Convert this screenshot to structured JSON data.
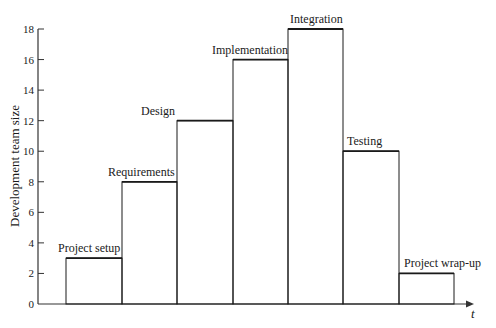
{
  "chart_data": {
    "type": "bar",
    "style": "step",
    "title": "",
    "xlabel": "t",
    "ylabel": "Development team size",
    "ylim": [
      0,
      18
    ],
    "yticks": [
      0,
      2,
      4,
      6,
      8,
      10,
      12,
      14,
      16,
      18
    ],
    "grid": false,
    "legend": null,
    "categories": [
      "Project setup",
      "Requirements",
      "Design",
      "Implementation",
      "Integration",
      "Testing",
      "Project wrap-up"
    ],
    "values": [
      3,
      8,
      12,
      16,
      18,
      10,
      2
    ],
    "colors": {
      "line": "#1a1a1a",
      "axis": "#333333",
      "background": "#ffffff"
    }
  }
}
